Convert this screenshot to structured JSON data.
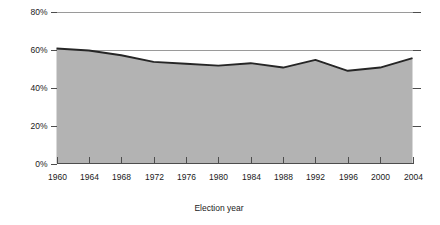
{
  "chart_data": {
    "type": "area",
    "title": "",
    "subtitle": "",
    "xlabel": "Election year",
    "ylabel": "",
    "categories": [
      1960,
      1964,
      1968,
      1972,
      1976,
      1980,
      1984,
      1988,
      1992,
      1996,
      2000,
      2004
    ],
    "values": [
      60.5,
      59.5,
      57.0,
      53.5,
      52.5,
      51.5,
      52.8,
      50.5,
      54.5,
      48.8,
      50.5,
      55.5
    ],
    "series": [
      {
        "name": "Voter turnout",
        "values": [
          60.5,
          59.5,
          57.0,
          53.5,
          52.5,
          51.5,
          52.8,
          50.5,
          54.5,
          48.8,
          50.5,
          55.5
        ]
      }
    ],
    "x": [
      1960,
      1964,
      1968,
      1972,
      1976,
      1980,
      1984,
      1988,
      1992,
      1996,
      2000,
      2004
    ],
    "xlim": [
      1960,
      2004
    ],
    "ylim": [
      0,
      80
    ],
    "ytick_values": [
      0,
      20,
      40,
      60,
      80
    ],
    "ytick_labels": [
      "0%",
      "20%",
      "40%",
      "60%",
      "80%"
    ],
    "xtick_labels": [
      "1960",
      "1964",
      "1968",
      "1972",
      "1976",
      "1980",
      "1984",
      "1988",
      "1992",
      "1996",
      "2000",
      "2004"
    ],
    "grid": true,
    "grid_axis": "y",
    "legend": false,
    "legend_position": "none",
    "annotations": [],
    "colors": {
      "area_fill": "#b3b3b3",
      "line": "#262626",
      "gridline": "#9a9a9a",
      "axis": "#4d4d4d",
      "text": "#1a1a1a",
      "background": "#ffffff"
    }
  }
}
